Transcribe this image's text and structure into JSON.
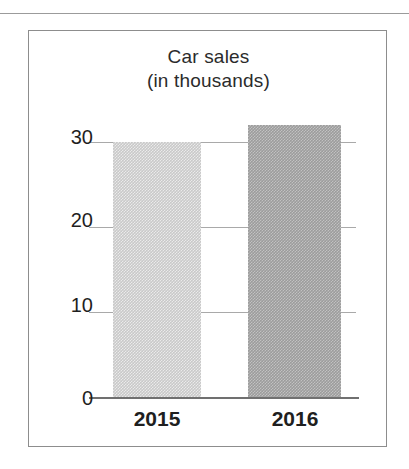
{
  "page": {
    "background": "#ffffff",
    "top_rule_color": "#9b9b9b",
    "frame_border_color": "#8d8d8d"
  },
  "chart_data": {
    "type": "bar",
    "title": "Car sales",
    "subtitle": "(in thousands)",
    "categories": [
      "2015",
      "2016"
    ],
    "values": [
      30,
      32
    ],
    "series": [
      {
        "name": "Car sales",
        "values": [
          30,
          32
        ]
      }
    ],
    "xlabel": "",
    "ylabel": "",
    "ylim": [
      0,
      35
    ],
    "yticks": [
      "0",
      "10",
      "20",
      "30"
    ],
    "ytick_values": [
      0,
      10,
      20,
      30
    ],
    "grid": true,
    "legend": false,
    "bar_colors": [
      "#c9c9c9",
      "#9c9c9c"
    ],
    "units": "thousands"
  },
  "axis": {
    "y": {
      "t30": "30",
      "t20": "20",
      "t10": "10",
      "t0": "0"
    },
    "x": {
      "c0": "2015",
      "c1": "2016"
    }
  }
}
